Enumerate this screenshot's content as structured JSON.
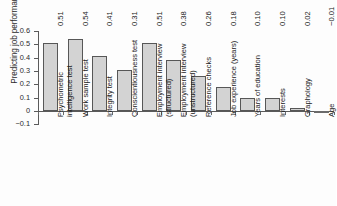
{
  "chart_data": {
    "type": "bar",
    "title": "",
    "subtitle": "",
    "xlabel": "",
    "ylabel": "Predicting job performance",
    "ylim": [
      -0.1,
      0.6
    ],
    "yticks": [
      "0.6",
      "0.5",
      "0.4",
      "0.3",
      "0.2",
      "0.1",
      "0",
      "−0.1"
    ],
    "grid": false,
    "legend": "none",
    "categories": [
      "Psychometric intelligence test",
      "Work sample test",
      "Integrity test",
      "Conscientiousness test",
      "Employment interview (structured)",
      "Employment interview (unstructured)",
      "Reference checks",
      "Job experience (years)",
      "Years of education",
      "Interests",
      "Graphology",
      "Age"
    ],
    "category_lines": [
      [
        "Psychometric",
        "intelligence test"
      ],
      [
        "Work sample test",
        ""
      ],
      [
        "Integrity test",
        ""
      ],
      [
        "Conscientiousness test",
        ""
      ],
      [
        "Employment interview",
        "(structured)"
      ],
      [
        "Employment interview",
        "(unstructured)"
      ],
      [
        "Reference checks",
        ""
      ],
      [
        "Job experience (years)",
        ""
      ],
      [
        "Years of education",
        ""
      ],
      [
        "Interests",
        ""
      ],
      [
        "Graphology",
        ""
      ],
      [
        "Age",
        ""
      ]
    ],
    "values": [
      0.51,
      0.54,
      0.41,
      0.31,
      0.51,
      0.38,
      0.26,
      0.18,
      0.1,
      0.1,
      0.02,
      -0.01
    ],
    "value_labels": [
      "0.51",
      "0.54",
      "0.41",
      "0.31",
      "0.51",
      "0.38",
      "0.26",
      "0.18",
      "0.10",
      "0.10",
      "0.02",
      "−0.01"
    ]
  },
  "style": {
    "bar_fill": "#d3d3d3",
    "bar_stroke": "#575757",
    "axis_color": "#5a5a5a",
    "text_color": "#2b2b2b",
    "background": "#fdfdfd"
  }
}
